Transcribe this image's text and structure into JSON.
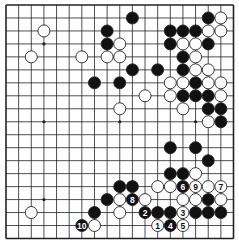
{
  "diagram": {
    "type": "go-board",
    "size": 19,
    "colors": {
      "board": "#ffffff",
      "line": "#222222",
      "black_stone": "#111111",
      "white_stone": "#ffffff",
      "stone_outline": "#222222"
    },
    "star_points": [
      [
        3,
        3
      ],
      [
        9,
        3
      ],
      [
        15,
        3
      ],
      [
        3,
        9
      ],
      [
        9,
        9
      ],
      [
        15,
        9
      ],
      [
        3,
        15
      ],
      [
        9,
        15
      ],
      [
        15,
        15
      ]
    ],
    "black_stones": [
      [
        10,
        1
      ],
      [
        16,
        1
      ],
      [
        8,
        2
      ],
      [
        13,
        2
      ],
      [
        14,
        2
      ],
      [
        15,
        2
      ],
      [
        8,
        3
      ],
      [
        13,
        3
      ],
      [
        16,
        3
      ],
      [
        14,
        4
      ],
      [
        10,
        5
      ],
      [
        12,
        5
      ],
      [
        14,
        5
      ],
      [
        7,
        6
      ],
      [
        9,
        6
      ],
      [
        15,
        6
      ],
      [
        14,
        7
      ],
      [
        15,
        7
      ],
      [
        16,
        7
      ],
      [
        16,
        8
      ],
      [
        17,
        8
      ],
      [
        17,
        9
      ],
      [
        13,
        11
      ],
      [
        15,
        11
      ],
      [
        16,
        12
      ],
      [
        13,
        13
      ],
      [
        14,
        13
      ],
      [
        9,
        14
      ],
      [
        10,
        14
      ],
      [
        8,
        15
      ],
      [
        16,
        15
      ],
      [
        7,
        16
      ],
      [
        12,
        16
      ],
      [
        13,
        16
      ],
      [
        15,
        16
      ],
      [
        16,
        16
      ],
      [
        17,
        16
      ]
    ],
    "white_stones": [
      [
        17,
        1
      ],
      [
        3,
        2
      ],
      [
        16,
        2
      ],
      [
        17,
        2
      ],
      [
        9,
        3
      ],
      [
        14,
        3
      ],
      [
        15,
        3
      ],
      [
        2,
        4
      ],
      [
        6,
        4
      ],
      [
        8,
        4
      ],
      [
        9,
        4
      ],
      [
        15,
        4
      ],
      [
        15,
        5
      ],
      [
        16,
        5
      ],
      [
        13,
        6
      ],
      [
        14,
        6
      ],
      [
        16,
        6
      ],
      [
        17,
        6
      ],
      [
        11,
        7
      ],
      [
        13,
        7
      ],
      [
        17,
        7
      ],
      [
        9,
        8
      ],
      [
        14,
        8
      ],
      [
        16,
        9
      ],
      [
        15,
        13
      ],
      [
        12,
        14
      ],
      [
        13,
        14
      ],
      [
        16,
        14
      ],
      [
        9,
        15
      ],
      [
        11,
        15
      ],
      [
        14,
        15
      ],
      [
        15,
        15
      ],
      [
        17,
        15
      ],
      [
        2,
        16
      ],
      [
        9,
        16
      ],
      [
        7,
        17
      ]
    ],
    "numbered_moves": [
      {
        "label": "1",
        "color": "white",
        "col": 12,
        "row": 17
      },
      {
        "label": "2",
        "color": "black",
        "col": 11,
        "row": 16
      },
      {
        "label": "3",
        "color": "white",
        "col": 14,
        "row": 16
      },
      {
        "label": "4",
        "color": "black",
        "col": 13,
        "row": 17
      },
      {
        "label": "5",
        "color": "white",
        "col": 14,
        "row": 17
      },
      {
        "label": "6",
        "color": "black",
        "col": 14,
        "row": 14
      },
      {
        "label": "7",
        "color": "white",
        "col": 17,
        "row": 14
      },
      {
        "label": "8",
        "color": "black",
        "col": 10,
        "row": 15
      },
      {
        "label": "9",
        "color": "white",
        "col": 15,
        "row": 14
      },
      {
        "label": "10",
        "color": "black",
        "col": 6,
        "row": 17
      }
    ]
  }
}
